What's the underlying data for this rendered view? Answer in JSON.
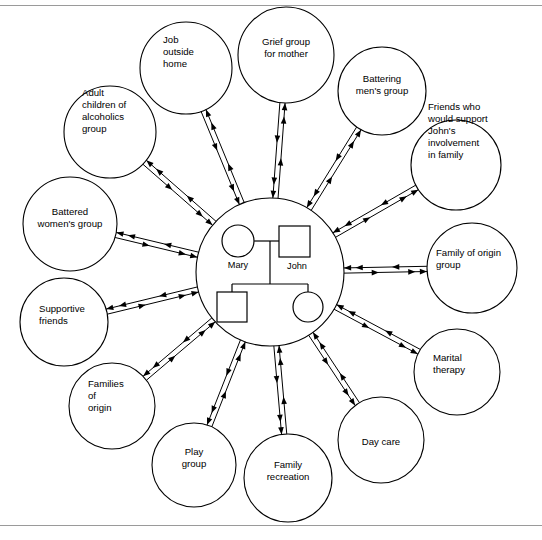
{
  "figure": {
    "type": "ecomap-diagram",
    "center": {
      "label": "family-household",
      "members": [
        {
          "name": "Mary",
          "symbol": "circle",
          "role": "mother"
        },
        {
          "name": "John",
          "symbol": "square",
          "role": "father"
        },
        {
          "name": "",
          "symbol": "square",
          "role": "son"
        },
        {
          "name": "",
          "symbol": "circle",
          "role": "daughter"
        }
      ]
    },
    "connection_style": "bidirectional-double-arrow",
    "nodes": [
      {
        "id": "job-outside-home",
        "lines": [
          "Job",
          "outside",
          "home"
        ],
        "align": "start"
      },
      {
        "id": "grief-group-for-mother",
        "lines": [
          "Grief group",
          "for mother"
        ],
        "align": "middle"
      },
      {
        "id": "battering-mens-group",
        "lines": [
          "Battering",
          "men's group"
        ],
        "align": "middle"
      },
      {
        "id": "friends-support-john",
        "lines": [
          "Friends who",
          "would support",
          "John's",
          "involvement",
          "in family"
        ],
        "align": "start"
      },
      {
        "id": "family-of-origin-group",
        "lines": [
          "Family of origin",
          "group"
        ],
        "align": "start"
      },
      {
        "id": "marital-therapy",
        "lines": [
          "Marital",
          "therapy"
        ],
        "align": "start"
      },
      {
        "id": "day-care",
        "lines": [
          "Day care"
        ],
        "align": "middle"
      },
      {
        "id": "family-recreation",
        "lines": [
          "Family",
          "recreation"
        ],
        "align": "middle"
      },
      {
        "id": "play-group",
        "lines": [
          "Play",
          "group"
        ],
        "align": "middle"
      },
      {
        "id": "families-of-origin",
        "lines": [
          "Families",
          "of",
          "origin"
        ],
        "align": "start"
      },
      {
        "id": "supportive-friends",
        "lines": [
          "Supportive",
          "friends"
        ],
        "align": "start"
      },
      {
        "id": "battered-womens-group",
        "lines": [
          "Battered",
          "women's group"
        ],
        "align": "middle"
      },
      {
        "id": "adult-children-alcoholics",
        "lines": [
          "Adult",
          "children of",
          "alcoholics",
          "group"
        ],
        "align": "start"
      }
    ],
    "colors": {
      "stroke": "#000000",
      "background": "#ffffff",
      "rule": "#9a9a9a"
    }
  }
}
